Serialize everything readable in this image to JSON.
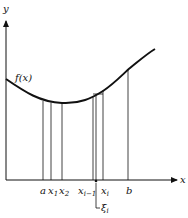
{
  "figure": {
    "axes": {
      "y_label": "y",
      "x_label": "x"
    },
    "curve_label": "f(x)",
    "tick_labels": [
      {
        "id": "a",
        "text": "a",
        "sub": ""
      },
      {
        "id": "x1",
        "text": "x",
        "sub": "1"
      },
      {
        "id": "x2",
        "text": "x",
        "sub": "2"
      },
      {
        "id": "xim1",
        "text": "x",
        "sub": "i−1"
      },
      {
        "id": "xi",
        "text": "x",
        "sub": "i"
      },
      {
        "id": "b",
        "text": "b",
        "sub": ""
      }
    ],
    "xi_point_label": {
      "text": "ξ",
      "sub": "i"
    },
    "colors": {
      "line": "#111111",
      "background": "#ffffff"
    }
  }
}
